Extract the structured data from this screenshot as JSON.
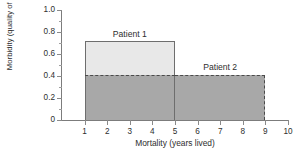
{
  "chart_data": {
    "type": "bar",
    "title": "",
    "xlabel": "Mortality (years lived)",
    "ylabel": "Morbidity (quality of life scale)",
    "xlim": [
      0,
      10
    ],
    "ylim": [
      0,
      1.0
    ],
    "grid": false,
    "legend_position": "inline-annotations",
    "x_ticks": [
      "1",
      "2",
      "3",
      "4",
      "5",
      "6",
      "7",
      "8",
      "9",
      "10"
    ],
    "x_tick_values": [
      1,
      2,
      3,
      4,
      5,
      6,
      7,
      8,
      9,
      10
    ],
    "y_ticks": [
      "0",
      "0.2",
      "0.4",
      "0.6",
      "0.8",
      "1.0"
    ],
    "y_tick_values": [
      0,
      0.2,
      0.4,
      0.6,
      0.8,
      1.0
    ],
    "y_minor_tick_values": [
      0.1,
      0.3,
      0.5,
      0.7,
      0.9
    ],
    "series": [
      {
        "name": "Patient 1",
        "label": "Patient 1",
        "x_start": 1,
        "x_end": 5,
        "years_lived": 4,
        "quality_of_life": 0.72,
        "segments": [
          {
            "name": "upper",
            "y_start": 0.41,
            "y_end": 0.72,
            "color": "#e8e8e8",
            "border": "solid"
          },
          {
            "name": "lower",
            "y_start": 0,
            "y_end": 0.41,
            "color": "#a8a8a8",
            "border": "solid"
          }
        ]
      },
      {
        "name": "Patient 2",
        "label": "Patient 2",
        "x_start": 5,
        "x_end": 9,
        "years_lived": 8,
        "quality_of_life": 0.41,
        "segments": [
          {
            "name": "body",
            "y_start": 0,
            "y_end": 0.41,
            "color": "#a8a8a8",
            "border": "dashed"
          }
        ]
      }
    ],
    "annotations": [
      {
        "text": "Patient 1",
        "x": 3.0,
        "y": 0.83
      },
      {
        "text": "Patient 2",
        "x": 7.0,
        "y": 0.53
      }
    ],
    "colors": {
      "light_fill": "#e8e8e8",
      "dark_fill": "#a8a8a8",
      "axis": "#7c7c7c",
      "outline": "#6e6e6e",
      "dashed": "#4a4a4a",
      "text": "#2e2e2e",
      "background": "#ffffff"
    }
  }
}
